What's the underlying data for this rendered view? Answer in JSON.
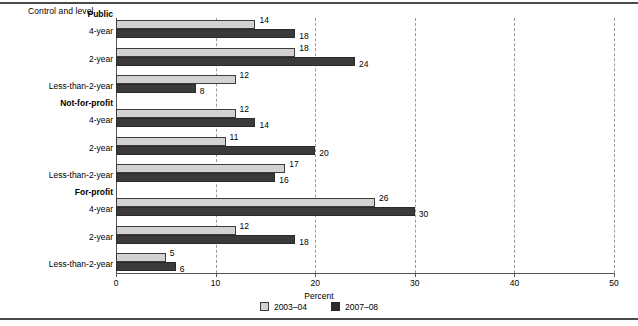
{
  "chart_data": {
    "type": "bar",
    "orientation": "horizontal",
    "title": "",
    "ylabel": "Control and level",
    "xlabel": "Percent",
    "xlim": [
      0,
      50
    ],
    "xticks": [
      0,
      10,
      20,
      30,
      40,
      50
    ],
    "xticklabels": [
      "0",
      "10",
      "20",
      "30",
      "40",
      "50"
    ],
    "grid": "vertical-dashed",
    "legend_position": "bottom-center",
    "groups": [
      {
        "header": "Public",
        "categories": [
          "4-year",
          "2-year",
          "Less-than-2-year"
        ]
      },
      {
        "header": "Not-for-profit",
        "categories": [
          "4-year",
          "2-year",
          "Less-than-2-year"
        ]
      },
      {
        "header": "For-profit",
        "categories": [
          "4-year",
          "2-year",
          "Less-than-2-year"
        ]
      }
    ],
    "categories": [
      "Public 4-year",
      "Public 2-year",
      "Public Less-than-2-year",
      "Not-for-profit 4-year",
      "Not-for-profit 2-year",
      "Not-for-profit Less-than-2-year",
      "For-profit 4-year",
      "For-profit 2-year",
      "For-profit Less-than-2-year"
    ],
    "series": [
      {
        "name": "2003-04",
        "color": "#d2d2d2",
        "values": [
          14,
          18,
          12,
          12,
          11,
          17,
          26,
          12,
          5
        ]
      },
      {
        "name": "2007-08",
        "color": "#3a3a3a",
        "values": [
          18,
          24,
          8,
          14,
          20,
          16,
          30,
          18,
          6
        ]
      }
    ]
  },
  "legend": {
    "items": [
      {
        "label": "2003–04",
        "color": "#d2d2d2"
      },
      {
        "label": "2007–08",
        "color": "#2b2b2b"
      }
    ]
  }
}
